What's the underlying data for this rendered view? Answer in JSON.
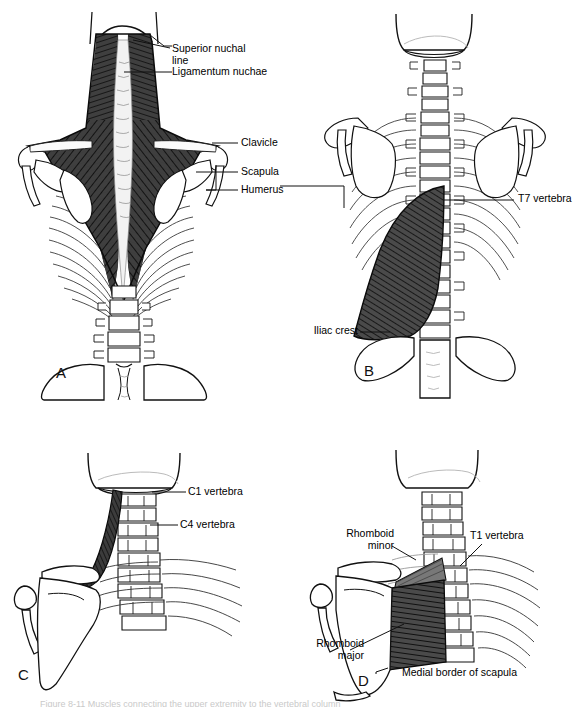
{
  "figure": {
    "width": 584,
    "height": 707,
    "background": "#ffffff",
    "ink": "#000000",
    "muscle_dark": "#3a3a3a",
    "muscle_mid": "#6e6e6e",
    "muscle_light": "#a8a8a8",
    "bone_fill": "#ffffff",
    "caption_text": "Figure 8-11  Muscles connecting the upper extremity to the vertebral column"
  },
  "panels": [
    {
      "id": "A",
      "letter": "A",
      "name": "trapezius-posterior-view",
      "labels": [
        {
          "id": "superior-nuchal-line",
          "text": "Superior nuchal\nline"
        },
        {
          "id": "ligamentum-nuchae",
          "text": "Ligamentum nuchae"
        },
        {
          "id": "clavicle",
          "text": "Clavicle"
        },
        {
          "id": "scapula",
          "text": "Scapula"
        },
        {
          "id": "humerus",
          "text": "Humerus"
        }
      ]
    },
    {
      "id": "B",
      "letter": "B",
      "name": "latissimus-dorsi-posterior-view",
      "labels": [
        {
          "id": "t7-vertebra",
          "text": "T7 vertebra"
        },
        {
          "id": "iliac-crest",
          "text": "Iliac crest"
        }
      ]
    },
    {
      "id": "C",
      "letter": "C",
      "name": "levator-scapulae-posterior-view",
      "labels": [
        {
          "id": "c1-vertebra",
          "text": "C1 vertebra"
        },
        {
          "id": "c4-vertebra",
          "text": "C4 vertebra"
        }
      ]
    },
    {
      "id": "D",
      "letter": "D",
      "name": "rhomboids-posterior-view",
      "labels": [
        {
          "id": "rhomboid-minor",
          "text": "Rhomboid\nminor"
        },
        {
          "id": "rhomboid-major",
          "text": "Rhomboid\nmajor"
        },
        {
          "id": "t1-vertebra",
          "text": "T1 vertebra"
        },
        {
          "id": "medial-border-of-scapula",
          "text": "Medial border of scapula"
        }
      ]
    }
  ]
}
